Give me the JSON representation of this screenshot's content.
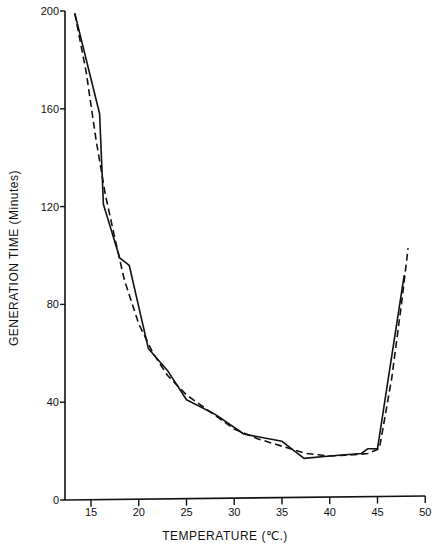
{
  "chart_data": {
    "type": "line",
    "title": "",
    "xlabel": "TEMPERATURE (℃.)",
    "ylabel": "GENERATION  TIME  (Minutes)",
    "xlim": [
      12,
      50
    ],
    "ylim": [
      0,
      200
    ],
    "xticks": [
      15,
      20,
      25,
      30,
      35,
      40,
      45,
      50
    ],
    "yticks": [
      0,
      40,
      80,
      120,
      160,
      200
    ],
    "grid": false,
    "legend": null,
    "series": [
      {
        "name": "observed",
        "style": "solid",
        "x": [
          13.3,
          15.9,
          16.3,
          18.0,
          19.0,
          21.0,
          23.0,
          25.0,
          28.0,
          31.0,
          35.0,
          37.3,
          40.0,
          43.3,
          44.0,
          45.0,
          47.8
        ],
        "y": [
          199,
          158,
          121,
          99,
          96,
          62,
          53,
          41,
          35,
          27,
          24,
          17,
          18,
          19,
          21,
          21,
          92
        ]
      },
      {
        "name": "fitted",
        "style": "dashed",
        "x": [
          13.3,
          14.5,
          15.5,
          16.5,
          17.5,
          18.5,
          20.0,
          21.5,
          23.0,
          25.0,
          27.5,
          30.0,
          32.5,
          35.0,
          37.5,
          40.0,
          42.5,
          44.0,
          45.2,
          46.5,
          47.5,
          48.2
        ],
        "y": [
          199,
          175,
          148,
          125,
          107,
          90,
          72,
          60,
          51,
          43,
          36,
          29,
          25,
          22,
          19,
          18,
          18.5,
          19,
          21,
          50,
          80,
          103
        ]
      }
    ]
  }
}
